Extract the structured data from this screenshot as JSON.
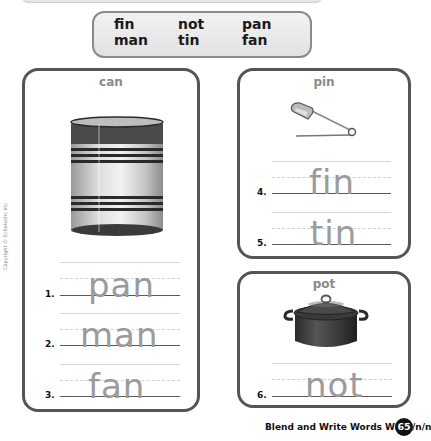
{
  "word_bank": {
    "rows": [
      [
        "fin",
        "not",
        "pan"
      ],
      [
        "man",
        "tin",
        "fan"
      ]
    ]
  },
  "copyright": "Copyright © Scholastic Inc.",
  "cards": {
    "can": {
      "title": "can",
      "picture": "tin-can-image",
      "items": [
        {
          "number": "1.",
          "answer": "pan"
        },
        {
          "number": "2.",
          "answer": "man"
        },
        {
          "number": "3.",
          "answer": "fan"
        }
      ]
    },
    "pin": {
      "title": "pin",
      "picture": "safety-pin-image",
      "items": [
        {
          "number": "4.",
          "answer": "fin"
        },
        {
          "number": "5.",
          "answer": "tin"
        }
      ]
    },
    "pot": {
      "title": "pot",
      "picture": "cooking-pot-image",
      "items": [
        {
          "number": "6.",
          "answer": "not"
        }
      ]
    }
  },
  "footer": {
    "title": "Blend and Write Words With /n/n",
    "page_number": "65"
  }
}
